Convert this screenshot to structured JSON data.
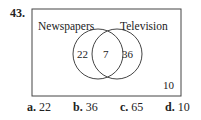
{
  "question_number": "43.",
  "venn": {
    "left_label": "Newspapers",
    "right_label": "Television",
    "left_only": "22",
    "intersection": "7",
    "right_only": "36",
    "outside": "10"
  },
  "choices": [
    {
      "letter": "a.",
      "value": "22"
    },
    {
      "letter": "b.",
      "value": "36"
    },
    {
      "letter": "c.",
      "value": "65"
    },
    {
      "letter": "d.",
      "value": "10"
    }
  ]
}
